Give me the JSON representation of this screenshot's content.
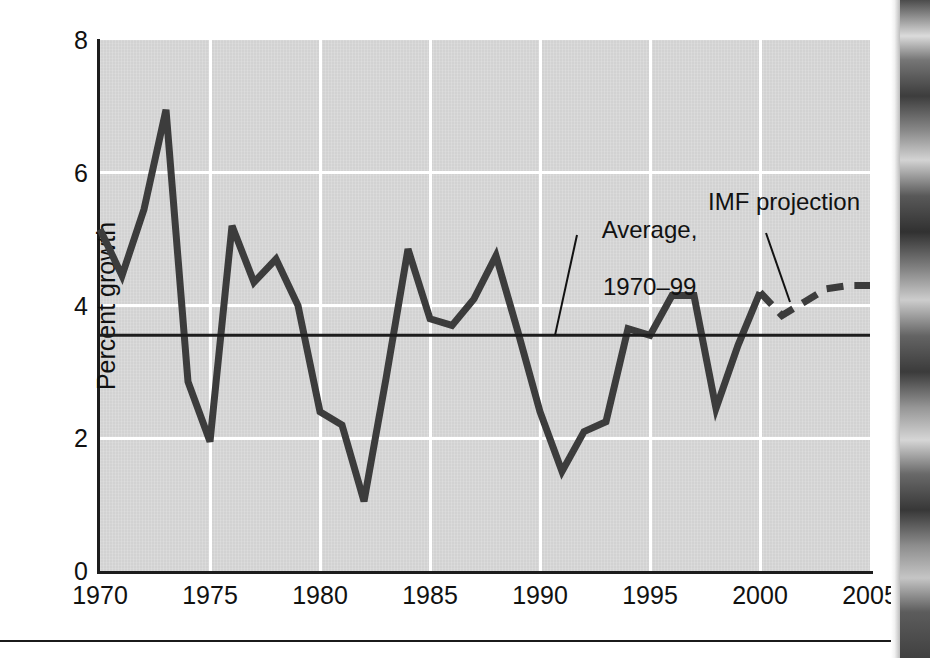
{
  "figure": {
    "background_color": "#ffffff",
    "plot_background_color": "#d2d2d2",
    "line_color": "#3c3c3c",
    "average_line_color": "#1d1d1d",
    "grid_color": "#ffffff"
  },
  "axes": {
    "y_label": "Percent growth",
    "y_ticks": [
      "0",
      "2",
      "4",
      "6",
      "8"
    ],
    "y_tick_values": [
      0,
      2,
      4,
      6,
      8
    ],
    "x_ticks": [
      "1970",
      "1975",
      "1980",
      "1985",
      "1990",
      "1995",
      "2000",
      "2005"
    ],
    "x_tick_values": [
      1970,
      1975,
      1980,
      1985,
      1990,
      1995,
      2000,
      2005
    ]
  },
  "annotations": {
    "average_label_line1": "Average,",
    "average_label_line2": "1970–99",
    "projection_label": "IMF projection"
  },
  "chart_data": {
    "type": "line",
    "title": "",
    "xlabel": "",
    "ylabel": "Percent growth",
    "xlim": [
      1970,
      2005
    ],
    "ylim": [
      0,
      8
    ],
    "grid": true,
    "legend": "none",
    "x": [
      1970,
      1971,
      1972,
      1973,
      1974,
      1975,
      1976,
      1977,
      1978,
      1979,
      1980,
      1981,
      1982,
      1983,
      1984,
      1985,
      1986,
      1987,
      1988,
      1989,
      1990,
      1991,
      1992,
      1993,
      1994,
      1995,
      1996,
      1997,
      1998,
      1999,
      2000
    ],
    "series": [
      {
        "name": "Actual world growth",
        "style": "solid",
        "values": [
          5.15,
          4.45,
          5.45,
          6.95,
          2.85,
          1.95,
          5.2,
          4.35,
          4.7,
          4.0,
          2.4,
          2.2,
          1.05,
          2.9,
          4.85,
          3.8,
          3.7,
          4.1,
          4.75,
          3.6,
          2.4,
          1.5,
          2.1,
          2.25,
          3.65,
          3.55,
          4.15,
          4.15,
          2.45,
          3.4,
          4.2
        ]
      },
      {
        "name": "IMF projection",
        "style": "dashed",
        "x": [
          2000,
          2001,
          2002,
          2003,
          2004,
          2005
        ],
        "values": [
          4.2,
          3.85,
          4.05,
          4.25,
          4.3,
          4.3
        ]
      }
    ],
    "reference_line": {
      "label": "Average, 1970–99",
      "value": 3.55,
      "orientation": "horizontal"
    }
  }
}
